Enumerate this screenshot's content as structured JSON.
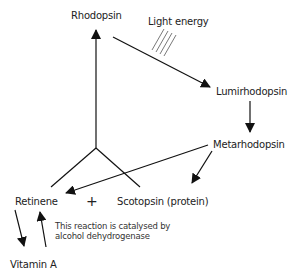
{
  "diagram": {
    "nodes": {
      "rhodopsin": "Rhodopsin",
      "light_energy": "Light energy",
      "lumirhodopsin": "Lumirhodopsin",
      "metarhodopsin": "Metarhodopsin",
      "retinene": "Retinene",
      "plus": "+",
      "scotopsin": "Scotopsin (protein)",
      "vitamin_a": "Vitamin A"
    },
    "annotation": "This reaction is catalysed by\nalcohol dehydrogenase",
    "edges": [
      {
        "from": "Retinene + Scotopsin (protein)",
        "to": "Rhodopsin"
      },
      {
        "from": "Rhodopsin",
        "to": "Lumirhodopsin",
        "label": "Light energy"
      },
      {
        "from": "Lumirhodopsin",
        "to": "Metarhodopsin"
      },
      {
        "from": "Metarhodopsin",
        "to": "Retinene"
      },
      {
        "from": "Metarhodopsin",
        "to": "Scotopsin (protein)"
      },
      {
        "from": "Retinene",
        "to": "Vitamin A"
      },
      {
        "from": "Vitamin A",
        "to": "Retinene"
      }
    ],
    "colors": {
      "line": "#111111",
      "text": "#222222",
      "background": "#ffffff"
    }
  }
}
